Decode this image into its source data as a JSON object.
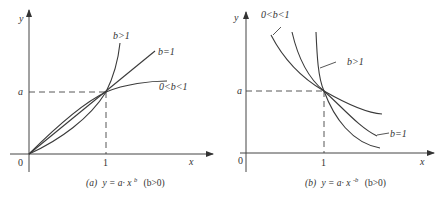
{
  "figure": {
    "panels": [
      {
        "id": "a",
        "caption_prefix": "(a)",
        "caption_formula": "y = a· x",
        "caption_exponent": "b",
        "caption_condition": "(b>0)",
        "axis_x_label": "x",
        "axis_y_label": "y",
        "origin_label": "0",
        "x_tick_label": "1",
        "y_tick_label": "a",
        "curves": [
          {
            "label": "b>1",
            "exponent_desc": "b>1"
          },
          {
            "label": "b=1",
            "exponent_desc": "b=1"
          },
          {
            "label": "0<b<1",
            "exponent_desc": "0<b<1"
          }
        ]
      },
      {
        "id": "b",
        "caption_prefix": "(b)",
        "caption_formula": "y = a· x",
        "caption_exponent": "-b",
        "caption_condition": "(b>0)",
        "axis_x_label": "x",
        "axis_y_label": "y",
        "origin_label": "0",
        "x_tick_label": "1",
        "y_tick_label": "a",
        "curves": [
          {
            "label": "0<b<1",
            "exponent_desc": "0<b<1"
          },
          {
            "label": "b>1",
            "exponent_desc": "b>1"
          },
          {
            "label": "b=1",
            "exponent_desc": "b=1"
          }
        ]
      }
    ]
  }
}
